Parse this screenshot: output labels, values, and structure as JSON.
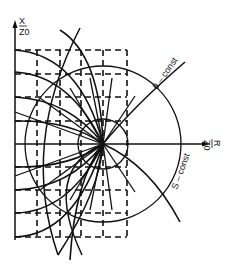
{
  "figure": {
    "type": "Smith-chart-like impedance plane mapping diagram",
    "axes": {
      "vertical": {
        "label_top": "X",
        "label_bottom": "Z0",
        "label_full": "X/Z0"
      },
      "horizontal": {
        "label_top": "R",
        "label_bottom": "Z0",
        "label_full": "R/Z0"
      }
    },
    "annotations": {
      "theta_curve": "θ – const",
      "s_curve": "S – const"
    },
    "colors": {
      "ink": "#111111",
      "background": "#ffffff"
    }
  }
}
